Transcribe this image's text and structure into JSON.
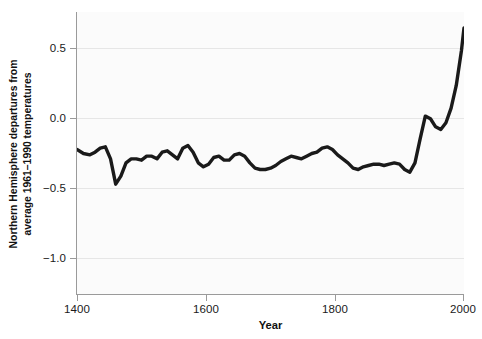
{
  "chart_data": {
    "type": "line",
    "title": "",
    "subtitle": "",
    "xlabel": "Year",
    "ylabel": "Northern Hemisphere departures from average 1961–1990 temperatures",
    "ylabel_lines": [
      "Northern Hemisphere departures from",
      "average 1961–1990 temperatures"
    ],
    "xlim": [
      1400,
      2000
    ],
    "ylim": [
      -1.35,
      0.77
    ],
    "xticks": [
      1400,
      1600,
      1800,
      2000
    ],
    "xtick_labels": [
      "1400",
      "1600",
      "1800",
      "2000"
    ],
    "yticks": [
      0.5,
      0.0,
      -0.5,
      -1.0
    ],
    "ytick_labels": [
      "0.5",
      "0.0",
      "−0.5",
      "−1.0"
    ],
    "grid": "horizontal",
    "legend": "none",
    "line_color": "#1a1a1a",
    "line_width": 3.4,
    "panel_background": "#fbfbfb",
    "gridline_color": "#e6e6e6",
    "axis_color": "#9a9a9a",
    "series": [
      {
        "name": "Northern Hemisphere temperature anomaly",
        "x": [
          1400,
          1410,
          1420,
          1428,
          1436,
          1444,
          1452,
          1460,
          1468,
          1476,
          1484,
          1492,
          1500,
          1508,
          1516,
          1524,
          1532,
          1540,
          1548,
          1556,
          1564,
          1572,
          1580,
          1588,
          1596,
          1604,
          1612,
          1620,
          1628,
          1636,
          1644,
          1652,
          1660,
          1668,
          1676,
          1684,
          1692,
          1700,
          1708,
          1716,
          1724,
          1732,
          1740,
          1748,
          1756,
          1764,
          1772,
          1780,
          1788,
          1796,
          1804,
          1812,
          1820,
          1828,
          1836,
          1844,
          1852,
          1860,
          1868,
          1876,
          1884,
          1892,
          1900,
          1908,
          1916,
          1924,
          1932,
          1940,
          1948,
          1956,
          1964,
          1972,
          1980,
          1988,
          1996,
          2000
        ],
        "y": [
          -0.26,
          -0.29,
          -0.3,
          -0.28,
          -0.25,
          -0.24,
          -0.33,
          -0.52,
          -0.46,
          -0.36,
          -0.33,
          -0.33,
          -0.34,
          -0.31,
          -0.31,
          -0.33,
          -0.28,
          -0.27,
          -0.3,
          -0.33,
          -0.25,
          -0.23,
          -0.28,
          -0.36,
          -0.39,
          -0.37,
          -0.32,
          -0.31,
          -0.34,
          -0.34,
          -0.3,
          -0.29,
          -0.31,
          -0.36,
          -0.4,
          -0.41,
          -0.41,
          -0.4,
          -0.38,
          -0.35,
          -0.33,
          -0.31,
          -0.32,
          -0.33,
          -0.31,
          -0.29,
          -0.28,
          -0.25,
          -0.24,
          -0.26,
          -0.3,
          -0.33,
          -0.36,
          -0.4,
          -0.41,
          -0.39,
          -0.38,
          -0.37,
          -0.37,
          -0.38,
          -0.37,
          -0.36,
          -0.37,
          -0.41,
          -0.43,
          -0.36,
          -0.18,
          -0.01,
          -0.03,
          -0.09,
          -0.11,
          -0.06,
          0.05,
          0.22,
          0.48,
          0.65
        ],
        "color": "#1a1a1a"
      }
    ]
  },
  "axes": {
    "x_title": "Year",
    "y_title_line1": "Northern Hemisphere departures from",
    "y_title_line2": "average 1961–1990 temperatures",
    "x_tick_labels": [
      "1400",
      "1600",
      "1800",
      "2000"
    ],
    "y_tick_labels": [
      "0.5",
      "0.0",
      "−0.5",
      "−1.0"
    ]
  }
}
